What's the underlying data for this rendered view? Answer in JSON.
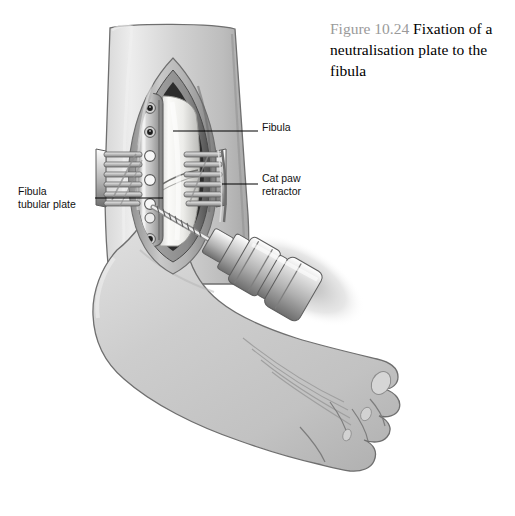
{
  "figure": {
    "number": "Figure 10.24",
    "caption": "Fixation of a neutralisation plate to the fibula",
    "caption_full": "Figure 10.24 Fixation of a neutralisation plate to the fibula",
    "caption_body": " Fixation of a neutralisation plate to the fibula"
  },
  "annotations": [
    {
      "id": "fibula",
      "label": "Fibula",
      "leader": {
        "from_x": 173,
        "from_y": 131,
        "to_x": 258,
        "to_y": 131
      }
    },
    {
      "id": "cat-paw-retractor",
      "label": "Cat paw\nretractor",
      "leader": {
        "from_x": 222,
        "from_y": 184,
        "to_x": 258,
        "to_y": 184
      }
    },
    {
      "id": "fibula-tubular-plate",
      "label": "Fibula\ntubular plate",
      "leader": {
        "from_x": 95,
        "from_y": 198,
        "to_x": 163,
        "to_y": 198
      }
    }
  ],
  "scene": {
    "title": "Open reduction internal fixation of the fibula",
    "view": "lateral view of right ankle and foot",
    "structures": [
      "lower leg shaft",
      "surgical wound with retracted skin edges",
      "fibula bone with oblique fracture",
      "one-third tubular plate",
      "cat paw retractor (left)",
      "cat paw retractor (right)",
      "power drill with spiral drill bit",
      "foot with toes"
    ]
  },
  "plate": {
    "name": "Fibula tubular plate",
    "hole_count": 7,
    "holes": [
      {
        "index": 1,
        "state": "screw-inserted"
      },
      {
        "index": 2,
        "state": "screw-inserted"
      },
      {
        "index": 3,
        "state": "open"
      },
      {
        "index": 4,
        "state": "open"
      },
      {
        "index": 5,
        "state": "open"
      },
      {
        "index": 6,
        "state": "being-drilled"
      },
      {
        "index": 7,
        "state": "screw-inserted"
      }
    ]
  },
  "retractors": {
    "left": {
      "name": "Cat paw retractor",
      "tine_count": 6
    },
    "right": {
      "name": "Cat paw retractor",
      "tine_count": 6
    }
  },
  "drill": {
    "name": "power drill",
    "bit": "spiral drill bit",
    "angle_deg": 32
  },
  "colors": {
    "background": "#ffffff",
    "caption_number": "#9a9a9a",
    "caption_text": "#000000",
    "annotation_text": "#111111",
    "leader_line": "#000000",
    "skin_light": "#e2e2e2",
    "skin_mid": "#c8c8c8",
    "skin_dark": "#9a9a9a",
    "outline": "#6b6b6b",
    "wound_dark": "#2b2b2b",
    "bone": "#f2f2f0",
    "metal_light": "#eceaea",
    "metal_mid": "#b4b4b4",
    "metal_dark": "#6f6f6f"
  }
}
